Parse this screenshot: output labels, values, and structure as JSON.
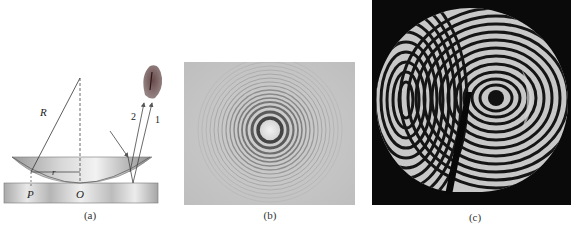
{
  "figure": {
    "panels": [
      {
        "id": "a",
        "caption": "(a)",
        "type": "diagram",
        "labels": {
          "radius": "R",
          "small_radius": "r",
          "point_p": "P",
          "point_o": "O",
          "ray_1": "1",
          "ray_2": "2"
        }
      },
      {
        "id": "b",
        "caption": "(b)",
        "type": "photo",
        "description": "Newton's rings interference pattern"
      },
      {
        "id": "c",
        "caption": "(c)",
        "type": "photo",
        "description": "Interference fringes on a non-uniform lens surface"
      }
    ]
  }
}
